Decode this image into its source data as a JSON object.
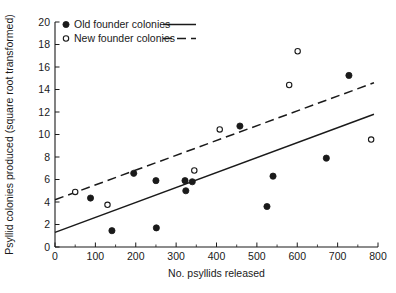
{
  "chart_data": {
    "type": "scatter",
    "title": "",
    "xlabel": "No. psyllids released",
    "ylabel": "Psyllid colonies produced (square root transformed)",
    "xlim": [
      0,
      800
    ],
    "ylim": [
      0,
      20
    ],
    "xticks": [
      0,
      100,
      200,
      300,
      400,
      500,
      600,
      700,
      800
    ],
    "xtick_labels": [
      "0",
      "100",
      "200",
      "300",
      "400",
      "500",
      "600",
      "700",
      "800"
    ],
    "yticks": [
      0,
      2,
      4,
      6,
      8,
      10,
      12,
      14,
      16,
      18,
      20
    ],
    "ytick_labels": [
      "0",
      "2",
      "4",
      "6",
      "8",
      "10",
      "12",
      "14",
      "16",
      "18",
      "20"
    ],
    "x_minor_tick_step": 50,
    "grid": false,
    "legend_position": "top-left",
    "series": [
      {
        "name": "Old founder colonies",
        "marker": "filled-circle",
        "color": "#1a1a1a",
        "line_style": "solid",
        "points": [
          {
            "x": 88,
            "y": 4.35
          },
          {
            "x": 141,
            "y": 1.45
          },
          {
            "x": 195,
            "y": 6.55
          },
          {
            "x": 250,
            "y": 5.9
          },
          {
            "x": 251,
            "y": 1.7
          },
          {
            "x": 322,
            "y": 5.9
          },
          {
            "x": 324,
            "y": 5.0
          },
          {
            "x": 340,
            "y": 5.8
          },
          {
            "x": 458,
            "y": 10.75
          },
          {
            "x": 525,
            "y": 3.6
          },
          {
            "x": 540,
            "y": 6.3
          },
          {
            "x": 672,
            "y": 7.9
          },
          {
            "x": 728,
            "y": 15.25
          }
        ],
        "fit_line": {
          "x0": 0,
          "y0": 1.3,
          "x1": 790,
          "y1": 11.8
        }
      },
      {
        "name": "New founder colonies",
        "marker": "open-circle",
        "color": "#1a1a1a",
        "line_style": "dashed",
        "points": [
          {
            "x": 50,
            "y": 4.9
          },
          {
            "x": 130,
            "y": 3.75
          },
          {
            "x": 345,
            "y": 6.8
          },
          {
            "x": 408,
            "y": 10.45
          },
          {
            "x": 580,
            "y": 14.4
          },
          {
            "x": 601,
            "y": 17.4
          },
          {
            "x": 783,
            "y": 9.55
          }
        ],
        "fit_line": {
          "x0": 0,
          "y0": 4.2,
          "x1": 790,
          "y1": 14.6
        }
      }
    ]
  },
  "legend": {
    "items": [
      {
        "label": "Old founder colonies",
        "marker": "filled-circle",
        "line": "solid"
      },
      {
        "label": "New founder colonies",
        "marker": "open-circle",
        "line": "dashed"
      }
    ]
  }
}
